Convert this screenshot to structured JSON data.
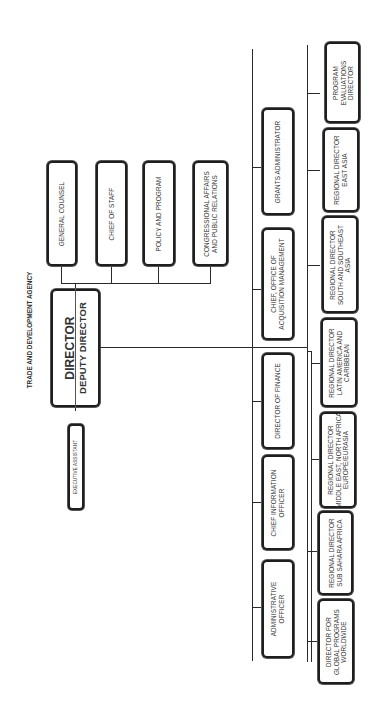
{
  "title": "TRADE AND DEVELOPMENT AGENCY",
  "director": {
    "line1": "DIRECTOR",
    "line2": "DEPUTY DIRECTOR"
  },
  "executive_assistant": "EXECUTIVE ASSISTANT",
  "staff": [
    {
      "lines": [
        "GENERAL COUNSEL"
      ]
    },
    {
      "lines": [
        "CHIEF OF STAFF"
      ]
    },
    {
      "lines": [
        "POLICY AND PROGRAM"
      ]
    },
    {
      "lines": [
        "CONGRESSIONAL AFFAIRS",
        "AND PUBLIC RELATIONS"
      ]
    }
  ],
  "operations": [
    {
      "lines": [
        "GRANTS ADMINISTRATOR"
      ]
    },
    {
      "lines": [
        "CHIEF, OFFICE OF",
        "ACQUISITION MANAGEMENT"
      ]
    },
    {
      "lines": [
        "DIRECTOR OF FINANCE"
      ]
    },
    {
      "lines": [
        "CHIEF INFORMATION",
        "OFFICER"
      ]
    },
    {
      "lines": [
        "ADMINISTRATIVE",
        "OFFICER"
      ]
    }
  ],
  "programs": [
    {
      "lines": [
        "PROGRAM",
        "EVALUATIONS",
        "DIRECTOR"
      ]
    },
    {
      "lines": [
        "REGIONAL DIRECTOR",
        "EAST ASIA"
      ]
    },
    {
      "lines": [
        "REGIONAL DIRECTOR",
        "SOUTH AND SOUTHEAST",
        "ASIA"
      ]
    },
    {
      "lines": [
        "REGIONAL DIRECTOR",
        "LATIN AMERICA AND",
        "CARIBBEAN"
      ]
    },
    {
      "lines": [
        "REGIONAL DIRECTOR",
        "MIDDLE EAST, NORTH AFRICA",
        "EUROPE/EURASIA"
      ]
    },
    {
      "lines": [
        "REGIONAL DIRECTOR",
        "SUB SAHARA AFRICA"
      ]
    },
    {
      "lines": [
        "DIRECTOR FOR",
        "GLOBAL PROGRAMS",
        "WORLDWIDE"
      ]
    }
  ],
  "colors": {
    "line": "#2a2a2a",
    "border": "#1e1e1e",
    "background": "#ffffff"
  }
}
